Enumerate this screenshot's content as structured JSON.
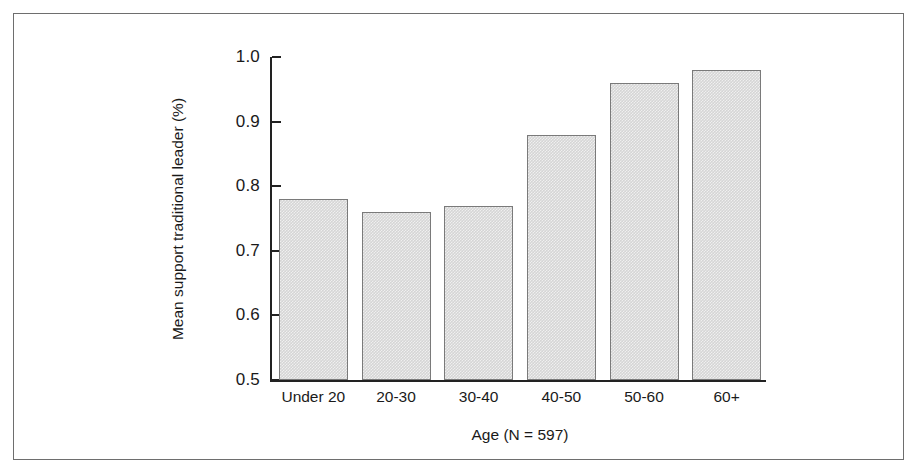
{
  "chart_data": {
    "type": "bar",
    "title": "",
    "subtitle": "",
    "xlabel": "Age (N = 597)",
    "ylabel": "Mean support traditional leader (%)",
    "categories": [
      "Under 20",
      "20-30",
      "30-40",
      "40-50",
      "50-60",
      "60+"
    ],
    "values": [
      0.78,
      0.76,
      0.77,
      0.88,
      0.96,
      0.98
    ],
    "series": [
      {
        "name": "Mean support traditional leader (%)",
        "values": [
          0.78,
          0.76,
          0.77,
          0.88,
          0.96,
          0.98
        ]
      }
    ],
    "ylim": [
      0.5,
      1.0
    ],
    "ytick_labels": [
      "1.0",
      "0.9",
      "0.8",
      "0.7",
      "0.6",
      "0.5"
    ],
    "ytick_values": [
      1.0,
      0.9,
      0.8,
      0.7,
      0.6,
      0.5
    ],
    "grid": false,
    "legend": false,
    "legend_position": "none",
    "bar_fill_color": "#d5d5d5",
    "bar_border_color": "#7a7a7a",
    "axis_color": "#222222",
    "frame_color": "#6e6e6e",
    "background_color": "#ffffff"
  }
}
